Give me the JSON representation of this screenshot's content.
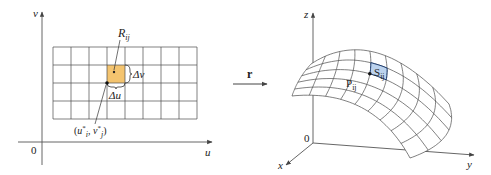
{
  "colors": {
    "axis": "#555555",
    "grid": "#4a4a4a",
    "region_fill": "#f4c46f",
    "patch_fill": "#bcd3ee",
    "patch_stroke": "#1f3f73",
    "text": "#222222"
  },
  "left_panel": {
    "axis_labels": {
      "vertical": "v",
      "horizontal": "u",
      "origin": "0"
    },
    "grid": {
      "columns": 8,
      "rows": 4,
      "x0": 53,
      "y0": 47,
      "x1": 197,
      "y1": 119
    },
    "highlight_cell": {
      "col": 3,
      "row": 1
    },
    "region_label": {
      "main": "R",
      "sub": "ij"
    },
    "delta_u_label": "Δu",
    "delta_v_label": "Δv",
    "sample_point_label": {
      "open": "(",
      "u": "u",
      "u_sup": "*",
      "u_sub": "i",
      "sep": ", ",
      "v": "v",
      "v_sup": "*",
      "v_sub": "j",
      "close": ")"
    }
  },
  "mapping_arrow": {
    "label": "r"
  },
  "right_panel": {
    "axis_labels": {
      "z": "z",
      "x": "x",
      "y": "y",
      "origin": "0"
    },
    "surface": {
      "u_divisions": 9,
      "v_divisions": 5,
      "highlight": {
        "i": 4,
        "j": 1
      }
    },
    "point_label": {
      "main": "P",
      "sub": "ij"
    },
    "patch_label": {
      "main": "S",
      "sub": "ij"
    }
  }
}
